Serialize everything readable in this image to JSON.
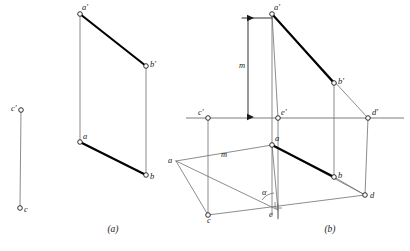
{
  "figure": {
    "caption_a": "(a)",
    "caption_b": "(b)",
    "footnote": "",
    "stroke_color": "#1a1a1a",
    "thin_color": "#6e6e72",
    "bold_color": "#000000",
    "point_fill": "#ffffff",
    "background": "#ffffff"
  },
  "fig_a": {
    "labels": {
      "a_top": "a'",
      "b_top": "b'",
      "a_bottom": "a",
      "b_bottom": "b",
      "c_top": "c'",
      "c_bottom": "c"
    },
    "points": {
      "a_top": {
        "x": 80,
        "y": 14
      },
      "b_top": {
        "x": 146,
        "y": 66
      },
      "a_bottom": {
        "x": 80,
        "y": 142
      },
      "b_bottom": {
        "x": 146,
        "y": 175
      },
      "c_top": {
        "x": 21,
        "y": 110
      },
      "c_bottom": {
        "x": 20,
        "y": 208
      }
    }
  },
  "fig_b": {
    "labels": {
      "a_top": "a'",
      "b_top": "b'",
      "c_top": "c'",
      "d_top": "d'",
      "e_top": "e'",
      "a_left": "a",
      "a_mid": "a",
      "b": "b",
      "c": "c",
      "d": "d",
      "e": "e",
      "m_vertical": "m",
      "m_horizontal": "m",
      "alpha": "α"
    },
    "points": {
      "a_top": {
        "x": 272,
        "y": 14
      },
      "b_top": {
        "x": 334,
        "y": 83
      },
      "c_top": {
        "x": 208,
        "y": 118
      },
      "e_top": {
        "x": 278,
        "y": 118
      },
      "d_top": {
        "x": 368,
        "y": 118
      },
      "a_left": {
        "x": 176,
        "y": 161
      },
      "a_mid": {
        "x": 272,
        "y": 145
      },
      "b": {
        "x": 334,
        "y": 177
      },
      "c": {
        "x": 208,
        "y": 215
      },
      "d": {
        "x": 365,
        "y": 195
      },
      "e": {
        "x": 278,
        "y": 210
      }
    },
    "ground_line": {
      "x1": 186,
      "y": 118,
      "x2": 404
    },
    "dimension": {
      "x": 248,
      "y_top": 18,
      "y_bottom": 117
    }
  }
}
